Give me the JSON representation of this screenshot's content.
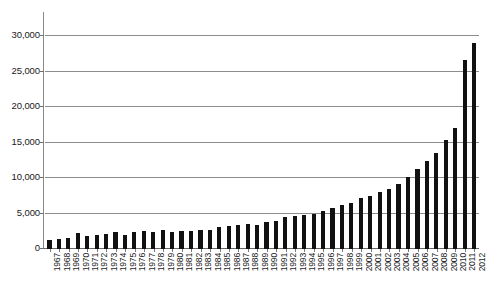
{
  "chart_data": {
    "type": "bar",
    "title": "",
    "subtitle": "",
    "xlabel": "",
    "ylabel": "",
    "ylim": [
      0,
      30000
    ],
    "grid": true,
    "legend": false,
    "legend_position": "none",
    "bar_color": "#111111",
    "gridline_color": "#8d8d8d",
    "axis_color": "#8a8a8a",
    "ytick_labels": [
      "30,000",
      "25,000",
      "20,000",
      "15,000",
      "10,000",
      "5,000",
      "0"
    ],
    "ytick_values": [
      30000,
      25000,
      20000,
      15000,
      10000,
      5000,
      0
    ],
    "categories": [
      "1967",
      "1968",
      "1969",
      "1970",
      "1971",
      "1972",
      "1973",
      "1974",
      "1975",
      "1976",
      "1977",
      "1978",
      "1979",
      "1980",
      "1981",
      "1982",
      "1983",
      "1984",
      "1985",
      "1986",
      "1987",
      "1988",
      "1989",
      "1990",
      "1991",
      "1992",
      "1993",
      "1994",
      "1995",
      "1996",
      "1997",
      "1998",
      "1999",
      "2000",
      "2001",
      "2002",
      "2003",
      "2004",
      "2005",
      "2006",
      "2007",
      "2008",
      "2009",
      "2010",
      "2011",
      "2012"
    ],
    "values": [
      1300,
      1450,
      1500,
      2300,
      1900,
      1950,
      2150,
      2350,
      2000,
      2350,
      2600,
      2450,
      2650,
      2400,
      2500,
      2550,
      2650,
      2700,
      3100,
      3250,
      3400,
      3500,
      3450,
      3750,
      3900,
      4500,
      4600,
      4750,
      4900,
      5300,
      5800,
      6200,
      6500,
      7200,
      7500,
      8100,
      8500,
      9200,
      10200,
      11300,
      12400,
      13500,
      15400,
      17100,
      26600,
      29000
    ]
  }
}
